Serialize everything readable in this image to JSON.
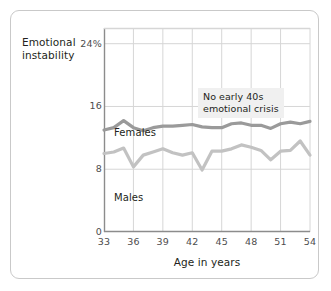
{
  "figure": {
    "y_axis_title": "Emotional\ninstability",
    "x_axis_title": "Age in years",
    "annotation": "No early 40s\nemotional crisis",
    "series_labels": {
      "females": "Females",
      "males": "Males"
    },
    "colors": {
      "females_line": "#9a9a9a",
      "males_line": "#c2c2c2",
      "grid": "#d6d6d6",
      "axis": "#8c8c8c",
      "frame": "#c9c9c9",
      "text": "#231f20",
      "tick_text": "#4d4d4d",
      "annotation_bg": "#f0f0f0"
    }
  },
  "chart_data": {
    "type": "line",
    "title": "",
    "xlabel": "Age in years",
    "ylabel": "Emotional instability",
    "xlim": [
      33,
      54
    ],
    "ylim": [
      0,
      26
    ],
    "xticks": [
      33,
      36,
      39,
      42,
      45,
      48,
      51,
      54
    ],
    "xtick_labels": [
      "33",
      "36",
      "39",
      "42",
      "45",
      "48",
      "51",
      "54"
    ],
    "yticks": [
      0,
      8,
      16,
      24
    ],
    "ytick_labels": [
      "0",
      "8",
      "16",
      "24%"
    ],
    "grid": true,
    "legend": "inline-labels",
    "annotations": [
      {
        "text": "No early 40s emotional crisis",
        "x": 45.5,
        "y": 21.5
      }
    ],
    "x": [
      33,
      34,
      35,
      36,
      37,
      38,
      39,
      40,
      41,
      42,
      43,
      44,
      45,
      46,
      47,
      48,
      49,
      50,
      51,
      52,
      53,
      54
    ],
    "series": [
      {
        "name": "Females",
        "color": "#9a9a9a",
        "values": [
          13.0,
          13.3,
          14.2,
          13.3,
          12.9,
          13.3,
          13.5,
          13.5,
          13.6,
          13.7,
          13.4,
          13.3,
          13.3,
          13.8,
          13.9,
          13.6,
          13.6,
          13.2,
          13.8,
          14.0,
          13.8,
          14.1
        ]
      },
      {
        "name": "Males",
        "color": "#c2c2c2",
        "values": [
          10.0,
          10.2,
          10.7,
          8.3,
          9.8,
          10.2,
          10.6,
          10.1,
          9.8,
          10.1,
          7.9,
          10.3,
          10.3,
          10.6,
          11.1,
          10.8,
          10.4,
          9.2,
          10.3,
          10.4,
          11.6,
          9.8
        ]
      }
    ]
  }
}
